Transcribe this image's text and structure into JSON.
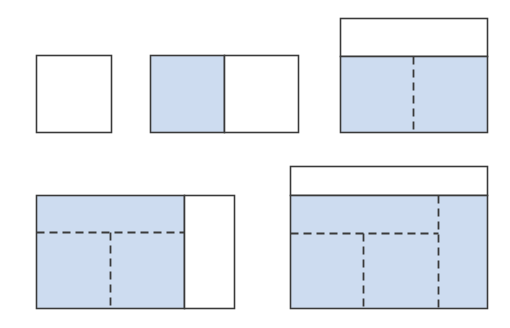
{
  "diagram": {
    "colors": {
      "background": "#ffffff",
      "fill_highlight": "#cddcf0",
      "fill_plain": "#ffffff",
      "stroke": "#3a3a3a"
    },
    "figures": [
      {
        "id": "fig-1",
        "description": "single empty square",
        "rects": [
          {
            "x": 36,
            "y": 55,
            "w": 75,
            "h": 77,
            "fill": "plain"
          }
        ],
        "solid_lines": [],
        "dashed_lines": []
      },
      {
        "id": "fig-2",
        "description": "two squares side by side, left shaded",
        "rects": [
          {
            "x": 150,
            "y": 55,
            "w": 74,
            "h": 77,
            "fill": "highlight"
          },
          {
            "x": 224,
            "y": 55,
            "w": 74,
            "h": 77,
            "fill": "plain"
          }
        ],
        "solid_lines": [],
        "dashed_lines": []
      },
      {
        "id": "fig-3",
        "description": "empty band on top, shaded region below split by dashed vertical",
        "rects": [
          {
            "x": 340,
            "y": 18,
            "w": 147,
            "h": 38,
            "fill": "plain"
          },
          {
            "x": 340,
            "y": 56,
            "w": 147,
            "h": 76,
            "fill": "highlight"
          }
        ],
        "solid_lines": [],
        "dashed_lines": [
          {
            "x1": 413,
            "y1": 56,
            "x2": 413,
            "y2": 132
          }
        ]
      },
      {
        "id": "fig-4",
        "description": "shaded block with dashed T subdivision, empty column on right",
        "rects": [
          {
            "x": 36,
            "y": 195,
            "w": 148,
            "h": 113,
            "fill": "highlight"
          },
          {
            "x": 184,
            "y": 195,
            "w": 50,
            "h": 113,
            "fill": "plain"
          }
        ],
        "solid_lines": [],
        "dashed_lines": [
          {
            "x1": 36,
            "y1": 232,
            "x2": 184,
            "y2": 232
          },
          {
            "x1": 110,
            "y1": 232,
            "x2": 110,
            "y2": 308
          }
        ]
      },
      {
        "id": "fig-5",
        "description": "empty top band, shaded region with dashed T subdivision and dashed right column",
        "rects": [
          {
            "x": 290,
            "y": 166,
            "w": 197,
            "h": 29,
            "fill": "plain"
          },
          {
            "x": 290,
            "y": 195,
            "w": 197,
            "h": 113,
            "fill": "highlight"
          }
        ],
        "solid_lines": [],
        "dashed_lines": [
          {
            "x1": 438,
            "y1": 195,
            "x2": 438,
            "y2": 308
          },
          {
            "x1": 290,
            "y1": 233,
            "x2": 438,
            "y2": 233
          },
          {
            "x1": 363,
            "y1": 233,
            "x2": 363,
            "y2": 308
          }
        ]
      }
    ]
  }
}
